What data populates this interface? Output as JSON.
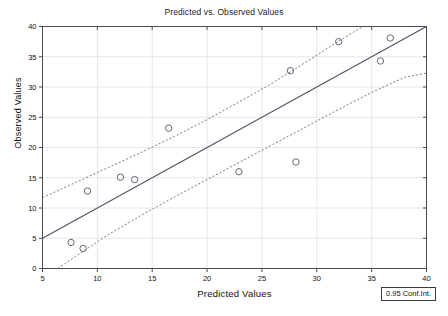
{
  "chart_data": {
    "type": "scatter",
    "title": "Predicted vs. Observed Values",
    "xlabel": "Predicted Values",
    "ylabel": "Observed Values",
    "xlim": [
      5,
      40
    ],
    "ylim": [
      0,
      40
    ],
    "xticks": [
      5,
      10,
      15,
      20,
      25,
      30,
      35,
      40
    ],
    "yticks": [
      0,
      5,
      10,
      15,
      20,
      25,
      30,
      35,
      40
    ],
    "grid": true,
    "legend_position": "bottom-right",
    "legend_entries": [
      "0.95 Conf.Int."
    ],
    "points": [
      {
        "x": 7.6,
        "y": 4.3
      },
      {
        "x": 8.7,
        "y": 3.3
      },
      {
        "x": 9.1,
        "y": 12.8
      },
      {
        "x": 12.1,
        "y": 15.1
      },
      {
        "x": 13.4,
        "y": 14.7
      },
      {
        "x": 16.5,
        "y": 23.2
      },
      {
        "x": 22.9,
        "y": 16.0
      },
      {
        "x": 27.6,
        "y": 32.7
      },
      {
        "x": 28.1,
        "y": 17.6
      },
      {
        "x": 32.0,
        "y": 37.5
      },
      {
        "x": 35.8,
        "y": 34.3
      },
      {
        "x": 36.7,
        "y": 38.1
      }
    ],
    "regression_line": {
      "name": "fit",
      "x0": 5.0,
      "y0": 5.0,
      "x1": 40.0,
      "y1": 40.0
    },
    "conf_band_upper": {
      "name": "0.95 Conf.Int. upper",
      "x": [
        5.0,
        8.0,
        11.0,
        14.0,
        17.0,
        20.0,
        23.0,
        26.0,
        29.0,
        32.0,
        34.2
      ],
      "y": [
        11.7,
        14.2,
        16.7,
        19.2,
        21.8,
        24.6,
        27.6,
        30.7,
        34.1,
        37.6,
        40.0
      ]
    },
    "conf_band_lower": {
      "name": "0.95 Conf.Int. lower",
      "x": [
        6.4,
        8.0,
        11.0,
        14.0,
        17.0,
        20.0,
        23.0,
        26.0,
        29.0,
        32.0,
        35.0,
        38.0,
        40.0
      ],
      "y": [
        0.0,
        2.0,
        5.6,
        8.8,
        11.8,
        14.7,
        17.6,
        20.5,
        23.4,
        26.3,
        29.1,
        31.6,
        32.3
      ]
    }
  },
  "legend": {
    "conf_int_label": "0.95 Conf.Int."
  },
  "colors": {
    "axis": "#4d4d4d",
    "grid": "#e6e6e6",
    "regression": "#555566",
    "band": "#777788",
    "marker": "#666677",
    "text": "#111111",
    "background": "#ffffff"
  }
}
